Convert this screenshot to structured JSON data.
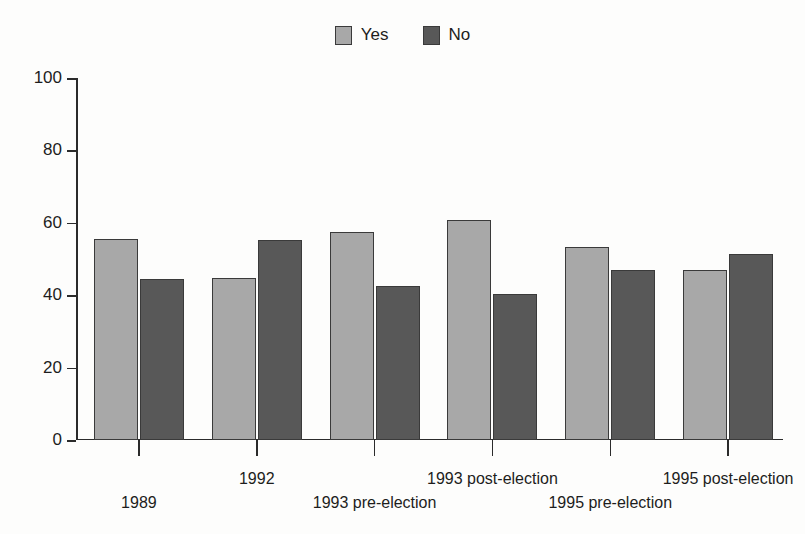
{
  "chart_data": {
    "type": "bar",
    "title": "",
    "xlabel": "",
    "ylabel": "",
    "ylim": [
      0,
      100
    ],
    "yticks": [
      0,
      20,
      40,
      60,
      80,
      100
    ],
    "grid": false,
    "legend_position": "top-center",
    "categories": [
      "1989",
      "1992",
      "1993 pre-election",
      "1993 post-election",
      "1995 pre-election",
      "1995 post-election"
    ],
    "series": [
      {
        "name": "Yes",
        "color": "#a8a8a8",
        "values": [
          55.4,
          44.8,
          57.4,
          60.7,
          53.4,
          46.9
        ]
      },
      {
        "name": "No",
        "color": "#585858",
        "values": [
          44.6,
          55.2,
          42.6,
          40.4,
          47.0,
          51.3
        ]
      }
    ]
  },
  "legend": {
    "items": [
      {
        "label": "Yes",
        "color": "#a8a8a8"
      },
      {
        "label": "No",
        "color": "#585858"
      }
    ]
  },
  "axis": {
    "y_tick_labels": [
      "100",
      "80",
      "60",
      "40",
      "20",
      "0"
    ]
  },
  "colors": {
    "yes_fill": "#a8a8a8",
    "no_fill": "#585858",
    "outline": "#3a3a3a",
    "axis": "#2b2b2b",
    "background": "#fdfdfc",
    "text": "#1d1d1d"
  }
}
